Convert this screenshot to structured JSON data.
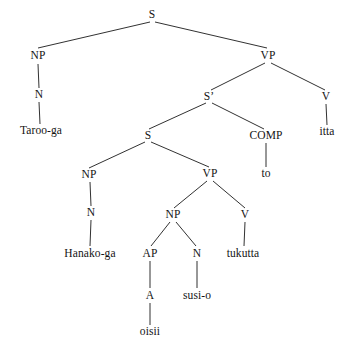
{
  "figure": {
    "type": "syntax-tree",
    "sentence": "Taroo-ga Hanako-ga oisii susi-o tukutta to itta",
    "background_color": "#ffffff",
    "line_color": "#1a1a1a",
    "text_color": "#141414",
    "width": 345,
    "height": 354
  },
  "nodes": [
    {
      "id": "s-root",
      "label": "S",
      "kind": "category",
      "x": 152,
      "y": 15
    },
    {
      "id": "np-1",
      "label": "NP",
      "kind": "category",
      "x": 38,
      "y": 56
    },
    {
      "id": "vp-1",
      "label": "VP",
      "kind": "category",
      "x": 268,
      "y": 56
    },
    {
      "id": "n-1",
      "label": "N",
      "kind": "category",
      "x": 39,
      "y": 95
    },
    {
      "id": "sbar",
      "label": "S’",
      "kind": "category",
      "x": 209,
      "y": 97
    },
    {
      "id": "v-1",
      "label": "V",
      "kind": "category",
      "x": 326,
      "y": 97
    },
    {
      "id": "taroo-ga",
      "label": "Taroo-ga",
      "kind": "leaf",
      "x": 41,
      "y": 131
    },
    {
      "id": "s-embedded",
      "label": "S",
      "kind": "category",
      "x": 148,
      "y": 136
    },
    {
      "id": "comp",
      "label": "COMP",
      "kind": "category",
      "x": 266,
      "y": 136
    },
    {
      "id": "itta",
      "label": "itta",
      "kind": "leaf",
      "x": 327,
      "y": 132
    },
    {
      "id": "np-2",
      "label": "NP",
      "kind": "category",
      "x": 89,
      "y": 175
    },
    {
      "id": "vp-2",
      "label": "VP",
      "kind": "category",
      "x": 210,
      "y": 174
    },
    {
      "id": "to",
      "label": "to",
      "kind": "leaf",
      "x": 266,
      "y": 174
    },
    {
      "id": "n-2",
      "label": "N",
      "kind": "category",
      "x": 91,
      "y": 213
    },
    {
      "id": "np-3",
      "label": "NP",
      "kind": "category",
      "x": 173,
      "y": 215
    },
    {
      "id": "v-2",
      "label": "V",
      "kind": "category",
      "x": 245,
      "y": 215
    },
    {
      "id": "hanako-ga",
      "label": "Hanako-ga",
      "kind": "leaf",
      "x": 90,
      "y": 254
    },
    {
      "id": "ap",
      "label": "AP",
      "kind": "category",
      "x": 150,
      "y": 254
    },
    {
      "id": "n-3",
      "label": "N",
      "kind": "category",
      "x": 197,
      "y": 254
    },
    {
      "id": "tukutta",
      "label": "tukutta",
      "kind": "leaf",
      "x": 243,
      "y": 254
    },
    {
      "id": "a-1",
      "label": "A",
      "kind": "category",
      "x": 150,
      "y": 296
    },
    {
      "id": "susi-o",
      "label": "susi-o",
      "kind": "leaf",
      "x": 197,
      "y": 296
    },
    {
      "id": "oisii",
      "label": "oisii",
      "kind": "leaf",
      "x": 150,
      "y": 332
    }
  ],
  "edges": [
    {
      "id": "e-root-np1",
      "from": "s-root",
      "to": "np-1",
      "x1": 150,
      "y1": 22,
      "x2": 38,
      "y2": 48
    },
    {
      "id": "e-root-vp1",
      "from": "s-root",
      "to": "vp-1",
      "x1": 155,
      "y1": 22,
      "x2": 267,
      "y2": 48
    },
    {
      "id": "e-np1-n1",
      "from": "np-1",
      "to": "n-1",
      "x1": 38,
      "y1": 64,
      "x2": 39,
      "y2": 88
    },
    {
      "id": "e-n1-taroo",
      "from": "n-1",
      "to": "taroo-ga",
      "x1": 39,
      "y1": 102,
      "x2": 40,
      "y2": 124
    },
    {
      "id": "e-vp1-sbar",
      "from": "vp-1",
      "to": "sbar",
      "x1": 265,
      "y1": 63,
      "x2": 211,
      "y2": 90
    },
    {
      "id": "e-vp1-v1",
      "from": "vp-1",
      "to": "v-1",
      "x1": 271,
      "y1": 63,
      "x2": 325,
      "y2": 90
    },
    {
      "id": "e-v1-itta",
      "from": "v-1",
      "to": "itta",
      "x1": 326,
      "y1": 104,
      "x2": 327,
      "y2": 125
    },
    {
      "id": "e-sbar-s2",
      "from": "sbar",
      "to": "s-embedded",
      "x1": 206,
      "y1": 103,
      "x2": 149,
      "y2": 129
    },
    {
      "id": "e-sbar-comp",
      "from": "sbar",
      "to": "comp",
      "x1": 212,
      "y1": 103,
      "x2": 264,
      "y2": 129
    },
    {
      "id": "e-comp-to",
      "from": "comp",
      "to": "to",
      "x1": 266,
      "y1": 143,
      "x2": 266,
      "y2": 167
    },
    {
      "id": "e-s2-np2",
      "from": "s-embedded",
      "to": "np-2",
      "x1": 145,
      "y1": 142,
      "x2": 89,
      "y2": 168
    },
    {
      "id": "e-s2-vp2",
      "from": "s-embedded",
      "to": "vp-2",
      "x1": 151,
      "y1": 142,
      "x2": 209,
      "y2": 167
    },
    {
      "id": "e-np2-n2",
      "from": "np-2",
      "to": "n-2",
      "x1": 90,
      "y1": 182,
      "x2": 91,
      "y2": 206
    },
    {
      "id": "e-n2-hanako",
      "from": "n-2",
      "to": "hanako-ga",
      "x1": 91,
      "y1": 220,
      "x2": 90,
      "y2": 246
    },
    {
      "id": "e-vp2-np3",
      "from": "vp-2",
      "to": "np-3",
      "x1": 207,
      "y1": 181,
      "x2": 174,
      "y2": 208
    },
    {
      "id": "e-vp2-v2",
      "from": "vp-2",
      "to": "v-2",
      "x1": 213,
      "y1": 181,
      "x2": 245,
      "y2": 208
    },
    {
      "id": "e-np3-ap",
      "from": "np-3",
      "to": "ap",
      "x1": 170,
      "y1": 222,
      "x2": 151,
      "y2": 246
    },
    {
      "id": "e-np3-n3",
      "from": "np-3",
      "to": "n-3",
      "x1": 176,
      "y1": 222,
      "x2": 196,
      "y2": 246
    },
    {
      "id": "e-v2-tukutta",
      "from": "v-2",
      "to": "tukutta",
      "x1": 245,
      "y1": 222,
      "x2": 244,
      "y2": 246
    },
    {
      "id": "e-ap-a",
      "from": "ap",
      "to": "a-1",
      "x1": 150,
      "y1": 261,
      "x2": 150,
      "y2": 288
    },
    {
      "id": "e-n3-susi",
      "from": "n-3",
      "to": "susi-o",
      "x1": 197,
      "y1": 261,
      "x2": 197,
      "y2": 288
    },
    {
      "id": "e-a-oisii",
      "from": "a-1",
      "to": "oisii",
      "x1": 150,
      "y1": 303,
      "x2": 150,
      "y2": 325
    }
  ]
}
